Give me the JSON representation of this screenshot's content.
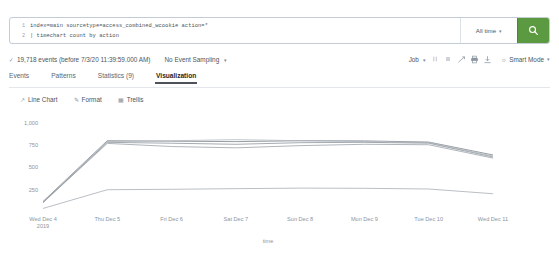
{
  "search": {
    "lines": [
      {
        "num": "1",
        "text": "index=main sourcetype=access_combined_wcookie action=*"
      },
      {
        "num": "2",
        "text": "| timechart count by action"
      }
    ],
    "time_range": "All time",
    "search_icon": "search-icon"
  },
  "results": {
    "event_count_text": "19,718 events (before 7/3/20 11:39:59.000 AM)",
    "sampling": "No Event Sampling",
    "job": "Job",
    "mode": "Smart Mode",
    "icons": [
      "pause-icon",
      "stop-icon",
      "share-icon",
      "print-icon",
      "export-icon"
    ]
  },
  "tabs": [
    {
      "label": "Events",
      "active": false
    },
    {
      "label": "Patterns",
      "active": false
    },
    {
      "label": "Statistics (9)",
      "active": false
    },
    {
      "label": "Visualization",
      "active": true
    }
  ],
  "chart_controls": [
    {
      "label": "Line Chart",
      "icon": "chart-type-icon"
    },
    {
      "label": "Format",
      "icon": "format-icon"
    },
    {
      "label": "Trellis",
      "icon": "trellis-icon"
    }
  ],
  "chart_data": {
    "type": "line",
    "title": "",
    "xlabel": "time",
    "ylabel": "",
    "ylim": [
      0,
      1100
    ],
    "yticks": [
      250,
      500,
      750,
      1000
    ],
    "ytick_labels": [
      "250",
      "500",
      "750",
      "1,000"
    ],
    "grid": false,
    "legend_position": "right",
    "categories": [
      "Wed Dec 4",
      "Thu Dec 5",
      "Fri Dec 6",
      "Sat Dec 7",
      "Sun Dec 8",
      "Mon Dec 9",
      "Tue Dec 10",
      "Wed Dec 11"
    ],
    "category_sublabels": [
      "2019",
      "",
      "",
      "",
      "",
      "",
      "",
      ""
    ],
    "series": [
      {
        "name": "addtocart",
        "color": "#7b838c",
        "values": [
          118,
          800,
          795,
          790,
          800,
          798,
          785,
          640
        ]
      },
      {
        "name": "changequantity",
        "color": "#9aa2aa",
        "values": [
          105,
          770,
          735,
          720,
          745,
          760,
          755,
          605
        ]
      },
      {
        "name": "purchase",
        "color": "#b0b7bd",
        "values": [
          112,
          790,
          800,
          812,
          800,
          790,
          780,
          628
        ]
      },
      {
        "name": "remove",
        "color": "#8e959d",
        "values": [
          108,
          782,
          772,
          760,
          778,
          782,
          772,
          618
        ]
      },
      {
        "name": "view",
        "color": "#a7aeb5",
        "values": [
          40,
          250,
          255,
          262,
          268,
          266,
          258,
          205
        ]
      }
    ]
  }
}
